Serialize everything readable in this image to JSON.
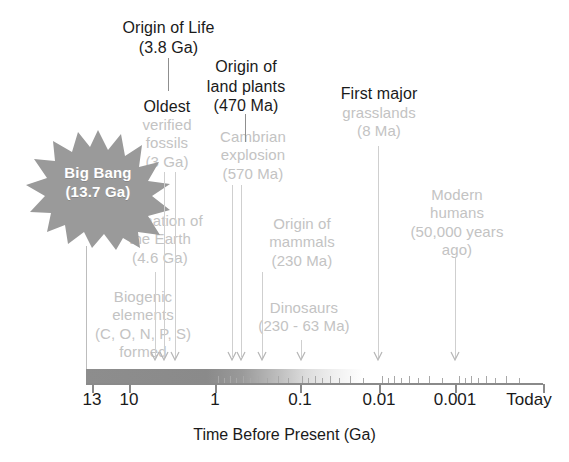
{
  "figure": {
    "type": "timeline",
    "axis_title": "Time Before Present (Ga)",
    "axis_scale": "logarithmic",
    "axis_direction": "decreasing left to right",
    "axis_labels": [
      "13",
      "10",
      "1",
      "0.1",
      "0.01",
      "0.001",
      "Today"
    ],
    "axis_label_x": [
      92,
      129,
      215,
      300,
      379,
      455,
      525
    ]
  },
  "bigbang": {
    "label": "Big Bang\n(13.7 Ga)",
    "fill_color": "#9a9a9a",
    "text_color": "#ffffff"
  },
  "events": [
    {
      "id": "formation-of-the-earth",
      "label": "Formation of\nthe Earth\n(4.6 Ga)",
      "value": "4.6 Ga",
      "emphasis": "gray",
      "color": "#c3c3c3"
    },
    {
      "id": "biogenic-elements",
      "label": "Biogenic\nelements\n(C, O, N, P, S)\nformed",
      "value": "",
      "emphasis": "gray",
      "color": "#c3c3c3"
    },
    {
      "id": "origin-of-life",
      "label": "Origin of Life\n(3.8 Ga)",
      "value": "3.8 Ga",
      "emphasis": "dark",
      "color": "#1a1a1a"
    },
    {
      "id": "oldest-verified-fossils-head",
      "label": "Oldest",
      "value": "3 Ga",
      "emphasis": "dark",
      "color": "#1a1a1a"
    },
    {
      "id": "oldest-verified-fossils-body",
      "label": "verified\nfossils\n(3 Ga)",
      "value": "3 Ga",
      "emphasis": "gray",
      "color": "#c3c3c3"
    },
    {
      "id": "origin-of-land-plants",
      "label": "Origin of\nland plants\n(470 Ma)",
      "value": "470 Ma",
      "emphasis": "dark",
      "color": "#1a1a1a"
    },
    {
      "id": "cambrian-explosion",
      "label": "Cambrian\nexplosion\n(570 Ma)",
      "value": "570 Ma",
      "emphasis": "gray",
      "color": "#c3c3c3"
    },
    {
      "id": "origin-of-mammals",
      "label": "Origin of\nmammals\n(230 Ma)",
      "value": "230 Ma",
      "emphasis": "gray",
      "color": "#c3c3c3"
    },
    {
      "id": "dinosaurs",
      "label": "Dinosaurs\n(230 - 63 Ma)",
      "value": "230 - 63 Ma",
      "emphasis": "gray",
      "color": "#c3c3c3"
    },
    {
      "id": "first-major-grasslands-head",
      "label": "First major",
      "value": "8 Ma",
      "emphasis": "dark",
      "color": "#1a1a1a"
    },
    {
      "id": "first-major-grasslands-body",
      "label": "grasslands\n(8 Ma)",
      "value": "8 Ma",
      "emphasis": "gray",
      "color": "#c3c3c3"
    },
    {
      "id": "modern-humans",
      "label": "Modern\nhumans\n(50,000 years\nago)",
      "value": "50,000 years ago",
      "emphasis": "gray",
      "color": "#c3c3c3"
    }
  ]
}
